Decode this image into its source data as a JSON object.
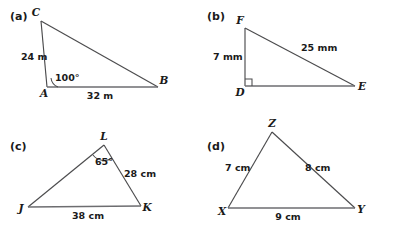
{
  "figure": {
    "background_color": "#ffffff",
    "stroke_color": "#4b4b4d",
    "base_stroke_color": "#6d6d70",
    "text_color": "#1a1a1a",
    "panels": [
      {
        "key": "a",
        "label": "(a)",
        "shape": "triangle",
        "vertices": [
          {
            "name": "C",
            "label": "C",
            "x": 41,
            "y": 21
          },
          {
            "name": "A",
            "label": "A",
            "x": 47,
            "y": 87
          },
          {
            "name": "B",
            "label": "B",
            "x": 158,
            "y": 87
          }
        ],
        "sides": [
          {
            "from": "C",
            "to": "A",
            "label": "24 m",
            "value": 24,
            "unit": "m"
          },
          {
            "from": "A",
            "to": "B",
            "label": "32 m",
            "value": 32,
            "unit": "m"
          },
          {
            "from": "C",
            "to": "B",
            "label": "",
            "value": null,
            "unit": ""
          }
        ],
        "angles": [
          {
            "at": "A",
            "label": "100°",
            "value": 100,
            "unit": "degrees",
            "marker": "arc"
          }
        ]
      },
      {
        "key": "b",
        "label": "(b)",
        "shape": "right-triangle",
        "vertices": [
          {
            "name": "F",
            "label": "F",
            "x": 245,
            "y": 28
          },
          {
            "name": "D",
            "label": "D",
            "x": 245,
            "y": 86
          },
          {
            "name": "E",
            "label": "E",
            "x": 355,
            "y": 86
          }
        ],
        "sides": [
          {
            "from": "F",
            "to": "D",
            "label": "7 mm",
            "value": 7,
            "unit": "mm"
          },
          {
            "from": "F",
            "to": "E",
            "label": "25 mm",
            "value": 25,
            "unit": "mm"
          },
          {
            "from": "D",
            "to": "E",
            "label": "",
            "value": null,
            "unit": ""
          }
        ],
        "angles": [
          {
            "at": "D",
            "label": "",
            "value": 90,
            "unit": "degrees",
            "marker": "right-angle-square"
          }
        ]
      },
      {
        "key": "c",
        "label": "(c)",
        "shape": "triangle",
        "vertices": [
          {
            "name": "L",
            "label": "L",
            "x": 104,
            "y": 145
          },
          {
            "name": "J",
            "label": "J",
            "x": 28,
            "y": 207
          },
          {
            "name": "K",
            "label": "K",
            "x": 141,
            "y": 206
          }
        ],
        "sides": [
          {
            "from": "L",
            "to": "K",
            "label": "28 cm",
            "value": 28,
            "unit": "cm"
          },
          {
            "from": "J",
            "to": "K",
            "label": "38 cm",
            "value": 38,
            "unit": "cm"
          },
          {
            "from": "J",
            "to": "L",
            "label": "",
            "value": null,
            "unit": ""
          }
        ],
        "angles": [
          {
            "at": "L",
            "label": "65°",
            "value": 65,
            "unit": "degrees",
            "marker": "arc"
          }
        ]
      },
      {
        "key": "d",
        "label": "(d)",
        "shape": "triangle",
        "vertices": [
          {
            "name": "Z",
            "label": "Z",
            "x": 272,
            "y": 132
          },
          {
            "name": "X",
            "label": "X",
            "x": 228,
            "y": 208
          },
          {
            "name": "Y",
            "label": "Y",
            "x": 355,
            "y": 208
          }
        ],
        "sides": [
          {
            "from": "X",
            "to": "Z",
            "label": "7 cm",
            "value": 7,
            "unit": "cm"
          },
          {
            "from": "Z",
            "to": "Y",
            "label": "8 cm",
            "value": 8,
            "unit": "cm"
          },
          {
            "from": "X",
            "to": "Y",
            "label": "9 cm",
            "value": 9,
            "unit": "cm"
          }
        ],
        "angles": []
      }
    ]
  },
  "labels": {
    "panel_a": "(a)",
    "panel_b": "(b)",
    "panel_c": "(c)",
    "panel_d": "(d)",
    "a_vertex_C": "C",
    "a_vertex_A": "A",
    "a_vertex_B": "B",
    "a_side_CA": "24 m",
    "a_side_AB": "32 m",
    "a_angle_A": "100°",
    "b_vertex_F": "F",
    "b_vertex_D": "D",
    "b_vertex_E": "E",
    "b_side_FD": "7 mm",
    "b_side_FE": "25 mm",
    "c_vertex_L": "L",
    "c_vertex_J": "J",
    "c_vertex_K": "K",
    "c_side_LK": "28 cm",
    "c_side_JK": "38 cm",
    "c_angle_L": "65°",
    "d_vertex_Z": "Z",
    "d_vertex_X": "X",
    "d_vertex_Y": "Y",
    "d_side_XZ": "7 cm",
    "d_side_ZY": "8 cm",
    "d_side_XY": "9 cm"
  }
}
